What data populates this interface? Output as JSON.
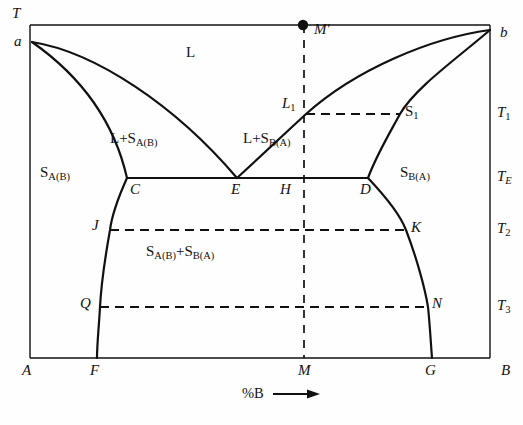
{
  "figure": {
    "kind": "binary-eutectic-phase-diagram",
    "background_color": "#fefefe",
    "line_color": "#111111",
    "axes": {
      "y_axis_label": "T",
      "x_axis_label": "%B",
      "x_axis_arrow": "⟶",
      "plot_left": 30,
      "plot_right": 490,
      "plot_top": 25,
      "plot_bottom": 358
    },
    "temperature_ticks": [
      {
        "label": "T",
        "sub": "1",
        "y": 114
      },
      {
        "label": "T",
        "sub": "E",
        "y": 178
      },
      {
        "label": "T",
        "sub": "2",
        "y": 230
      },
      {
        "label": "T",
        "sub": "3",
        "y": 307
      }
    ],
    "composition_ticks": [
      {
        "label": "A",
        "x": 30
      },
      {
        "label": "F",
        "x": 97
      },
      {
        "label": "M",
        "x": 305
      },
      {
        "label": "G",
        "x": 432
      },
      {
        "label": "B",
        "x": 490
      }
    ],
    "points": [
      {
        "label": "a",
        "x": 32,
        "y": 42,
        "style": "italic"
      },
      {
        "label": "b",
        "x": 490,
        "y": 30,
        "style": "italic"
      },
      {
        "label": "C",
        "x": 127,
        "y": 178,
        "style": "italic"
      },
      {
        "label": "E",
        "x": 237,
        "y": 178,
        "style": "italic"
      },
      {
        "label": "H",
        "x": 305,
        "y": 178,
        "style": "italic"
      },
      {
        "label": "D",
        "x": 368,
        "y": 178,
        "style": "italic"
      },
      {
        "label": "L",
        "sub": "1",
        "x": 306,
        "y": 114,
        "style": "italic"
      },
      {
        "label": "S",
        "sub": "1",
        "x": 400,
        "y": 114,
        "style": "upright"
      },
      {
        "label": "J",
        "x": 110,
        "y": 230,
        "style": "italic"
      },
      {
        "label": "K",
        "x": 406,
        "y": 230,
        "style": "italic"
      },
      {
        "label": "Q",
        "x": 100,
        "y": 307,
        "style": "italic"
      },
      {
        "label": "N",
        "x": 428,
        "y": 307,
        "style": "italic"
      },
      {
        "label": "M",
        "prime": "′",
        "x": 303,
        "y": 25,
        "style": "italic",
        "marker": "filled-dot"
      }
    ],
    "phase_regions": [
      {
        "name": "liquid",
        "text": "L",
        "x": 192,
        "y": 53
      },
      {
        "name": "liquid-plus-solid-A-in-B",
        "text": "L+S",
        "sub": "A(B)",
        "x": 131,
        "y": 140
      },
      {
        "name": "liquid-plus-solid-B-in-A",
        "text": "L+S",
        "sub": "B(A)",
        "x": 262,
        "y": 140
      },
      {
        "name": "solid-A-in-B",
        "text": "S",
        "sub": "A(B)",
        "x": 44,
        "y": 172
      },
      {
        "name": "solid-B-in-A",
        "text": "S",
        "sub": "B(A)",
        "x": 404,
        "y": 172
      },
      {
        "name": "two-solid-solutions",
        "text": "S",
        "sub": "A(B)",
        "text2": "+S",
        "sub2": "B(A)",
        "x": 152,
        "y": 250
      }
    ],
    "dashed_lines": [
      {
        "name": "tie-line-T1",
        "from_label": "L1",
        "to_label": "S1",
        "x1": 306,
        "x2": 400,
        "y": 114
      },
      {
        "name": "tie-line-T2",
        "from_label": "J",
        "to_label": "K",
        "x1": 110,
        "x2": 406,
        "y": 230
      },
      {
        "name": "tie-line-T3",
        "from_label": "Q",
        "to_label": "N",
        "x1": 100,
        "x2": 428,
        "y": 307
      },
      {
        "name": "isopleth-M",
        "from_label": "M'",
        "to_label": "M",
        "x": 304,
        "y1": 25,
        "y2": 358
      }
    ],
    "solid_curves": [
      {
        "name": "liquidus-left",
        "desc": "a to E"
      },
      {
        "name": "solidus-left",
        "desc": "a to C"
      },
      {
        "name": "liquidus-right",
        "desc": "b to E"
      },
      {
        "name": "solidus-right",
        "desc": "b to D"
      },
      {
        "name": "eutectic-horizontal",
        "desc": "C to D at T_E"
      },
      {
        "name": "solvus-left",
        "desc": "C to F"
      },
      {
        "name": "solvus-right",
        "desc": "D to G"
      }
    ]
  }
}
